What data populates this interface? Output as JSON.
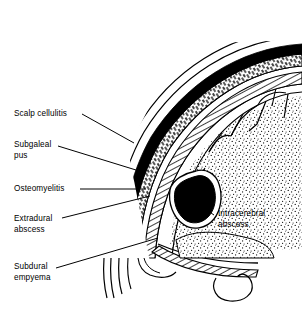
{
  "figure": {
    "width": 302,
    "height": 315,
    "background_color": "#ffffff",
    "ink_color": "#000000",
    "style": "black-and-white line drawing with stipple and hatch shading"
  },
  "labels": {
    "scalp_cellulitis": {
      "text": "Scalp cellulitis",
      "x": 14,
      "y": 109,
      "side": "left"
    },
    "subgaleal_pus": {
      "text": "Subgaleal\npus",
      "x": 14,
      "y": 140,
      "side": "left"
    },
    "osteomyelitis": {
      "text": "Osteomyelitis",
      "x": 14,
      "y": 184,
      "side": "left"
    },
    "extradural_abscess": {
      "text": "Extradural\nabscess",
      "x": 14,
      "y": 214,
      "side": "left"
    },
    "subdural_empyema": {
      "text": "Subdural\nempyema",
      "x": 14,
      "y": 262,
      "side": "left"
    },
    "intracerebral_abscess": {
      "text": "Intracerebral\nabscess",
      "x": 218,
      "y": 209,
      "side": "right"
    }
  },
  "anatomy": {
    "layers": [
      {
        "name": "skin-scalp-outline",
        "description": "outermost thin curved line of the scalp surface"
      },
      {
        "name": "scalp-cellulitis-zone",
        "description": "narrow clear band just beneath the skin line"
      },
      {
        "name": "subgaleal-pus-band",
        "description": "solid black crescent band under the scalp"
      },
      {
        "name": "skull-bone-band",
        "description": "hatched/speckled band representing diploic skull bone with osteomyelitis"
      },
      {
        "name": "extradural-space",
        "description": "thin band between bone and dura"
      },
      {
        "name": "dura-mater",
        "description": "dense hatched inner arc"
      },
      {
        "name": "subdural-space",
        "description": "thin clear line inside the dura"
      },
      {
        "name": "brain-cortex",
        "description": "stippled cerebral tissue with gyri and sulci"
      }
    ],
    "features": [
      {
        "name": "intracerebral-abscess-cavity",
        "description": "irregular solid black cavity with a white capsule ring within the brain"
      },
      {
        "name": "cerebral-sulci",
        "description": "short branching lines dividing the stippled gyri"
      },
      {
        "name": "tentorium",
        "description": "hatched band sweeping toward the skull base"
      },
      {
        "name": "temporal-lobe-hook",
        "description": "curved hook-shaped outline at the lower base"
      }
    ]
  }
}
